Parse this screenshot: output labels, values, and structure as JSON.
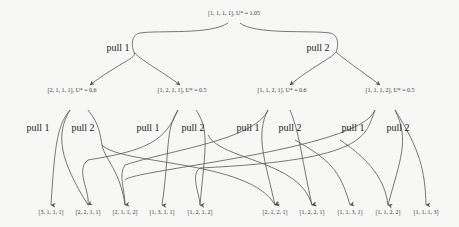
{
  "root": {
    "label": "[1, 1, 1, 1], U* = 1.05"
  },
  "level1": [
    {
      "edge_label": "pull 1"
    },
    {
      "edge_label": "pull 2"
    }
  ],
  "level2": [
    {
      "label": "[2, 1, 1, 1], U* = 0.6",
      "pull1": "pull 1",
      "pull2": "pull 2"
    },
    {
      "label": "[1, 2, 1, 1], U* = 0.5",
      "pull1": "pull 1",
      "pull2": "pull 2"
    },
    {
      "label": "[1, 1, 2, 1], U* = 0.6",
      "pull1": "pull 1",
      "pull2": "pull 2"
    },
    {
      "label": "[1, 1, 1, 2], U* = 0.5",
      "pull1": "pull 1",
      "pull2": "pull 2"
    }
  ],
  "leaves": [
    "[3, 1, 1, 1]",
    "[2, 2, 1, 1]",
    "[2, 1, 1, 2]",
    "[1, 3, 1, 1]",
    "[1, 2, 1, 2]",
    "[2, 1, 2, 1]",
    "[1, 2, 2, 1]",
    "[1, 1, 3, 1]",
    "[1, 1, 2, 2]",
    "[1, 1, 1, 3]"
  ],
  "colors": {
    "edge": "#555555",
    "background": "#f7f7f5",
    "text": "#333333"
  }
}
